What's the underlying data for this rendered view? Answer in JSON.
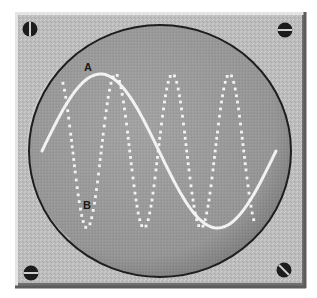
{
  "figure": {
    "colors": {
      "panel": "#b9b9b9",
      "panel_highlight": "#e6e6e6",
      "panel_shadow": "#6e6e6e",
      "screen": "#9c9c9c",
      "screen_rim": "#1e1e1e",
      "wave": "#f4f4f4",
      "screw": "#1c1c1c"
    },
    "screws": [
      {
        "name": "screw-top-left",
        "slot": "vertical"
      },
      {
        "name": "screw-top-right",
        "slot": "horizontal"
      },
      {
        "name": "screw-bottom-left",
        "slot": "horizontal"
      },
      {
        "name": "screw-bottom-right",
        "slot": "diagonal"
      }
    ]
  },
  "waves": {
    "A": {
      "label": "A",
      "style": "solid",
      "relative_frequency": 1,
      "cycles_shown": 1
    },
    "B": {
      "label": "B",
      "style": "dotted",
      "relative_frequency": 4,
      "cycles_shown": 3.5
    }
  }
}
